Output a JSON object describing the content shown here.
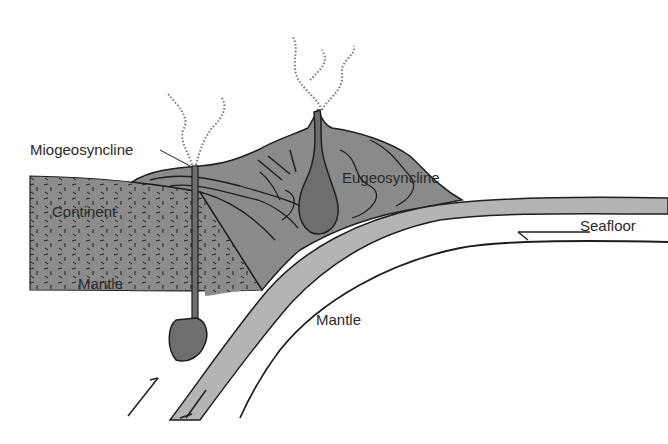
{
  "diagram": {
    "type": "cross-section",
    "labels": {
      "miogeosyncline": "Miogeosyncline",
      "eugeosyncline": "Eugeosyncline",
      "continent": "Continent",
      "mantle_left": "Mantle",
      "mantle_right": "Mantle",
      "seafloor": "Seafloor"
    },
    "colors": {
      "rock_fill": "#8a8a8a",
      "continent_fill": "#8c8c8c",
      "plate_fill": "#b4b4b4",
      "magma_fill": "#6e6e6e",
      "line": "#1e1e1e",
      "background": "#ffffff"
    }
  }
}
